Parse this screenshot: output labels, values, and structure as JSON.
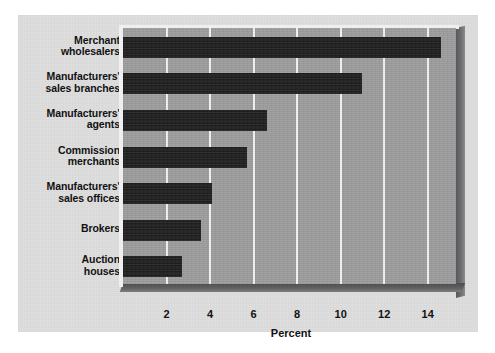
{
  "chart_data": {
    "type": "bar",
    "orientation": "horizontal",
    "title": "",
    "xlabel": "Percent",
    "ylabel": "",
    "categories": [
      "Merchant\nwholesalers",
      "Manufacturers'\nsales branches",
      "Manufacturers'\nagents",
      "Commission\nmerchants",
      "Manufacturers'\nsales offices",
      "Brokers",
      "Auction\nhouses"
    ],
    "values": [
      14.6,
      11.0,
      6.6,
      5.7,
      4.1,
      3.6,
      2.7
    ],
    "xticks": [
      2,
      4,
      6,
      8,
      10,
      12,
      14
    ],
    "xtick_labels": [
      "2",
      "4",
      "6",
      "8",
      "10",
      "12",
      "14"
    ],
    "xlim": [
      0,
      15.3
    ],
    "grid": "vertical-only",
    "legend": "none",
    "bar_color": "#1d1d1d",
    "plot_background": "#9d9d9d",
    "gridline_color": "#f2f2f2",
    "card_background": "#dedede",
    "text_color": "#121212"
  }
}
